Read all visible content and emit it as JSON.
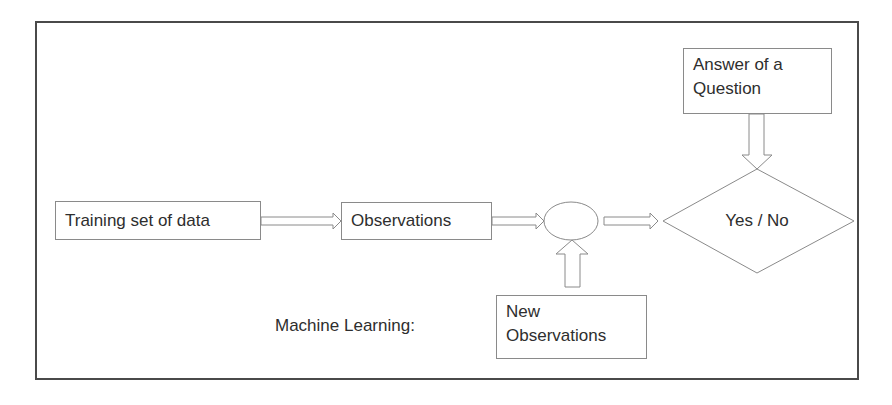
{
  "diagram": {
    "type": "flowchart",
    "title_label": "Machine Learning:",
    "nodes": {
      "training": {
        "label": "Training set of data",
        "shape": "rectangle"
      },
      "observations": {
        "label": "Observations",
        "shape": "rectangle"
      },
      "process": {
        "label": "",
        "shape": "ellipse"
      },
      "decision": {
        "label": "Yes / No",
        "shape": "diamond"
      },
      "answer": {
        "lines": [
          "Answer of a",
          "Question"
        ],
        "shape": "rectangle"
      },
      "new_observations": {
        "lines": [
          "New",
          "Observations"
        ],
        "shape": "rectangle"
      }
    },
    "edges": [
      {
        "from": "Training set of data",
        "to": "Observations",
        "style": "block-arrow"
      },
      {
        "from": "Observations",
        "to": "ellipse",
        "style": "block-arrow"
      },
      {
        "from": "ellipse",
        "to": "Yes / No",
        "style": "block-arrow"
      },
      {
        "from": "Answer of a Question",
        "to": "Yes / No",
        "style": "block-arrow-down"
      },
      {
        "from": "New Observations",
        "to": "ellipse",
        "style": "block-arrow-up"
      }
    ],
    "colors": {
      "frame": "#4a4a4a",
      "shape_stroke": "#8a8a8a",
      "text": "#2e2e2e",
      "background": "#ffffff"
    }
  }
}
